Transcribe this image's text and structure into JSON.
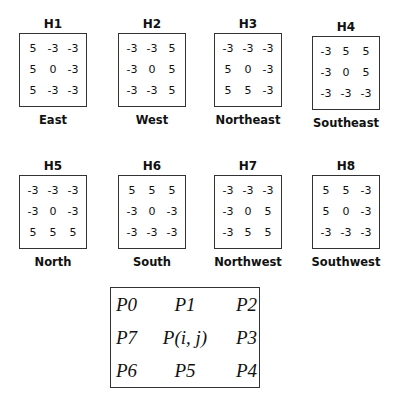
{
  "kernels": [
    {
      "id": "H1",
      "direction": "East",
      "matrix": [
        [
          "5",
          "-3",
          "-3"
        ],
        [
          "5",
          "0",
          "-3"
        ],
        [
          "5",
          "-3",
          "-3"
        ]
      ]
    },
    {
      "id": "H2",
      "direction": "West",
      "matrix": [
        [
          "-3",
          "-3",
          "5"
        ],
        [
          "-3",
          "0",
          "5"
        ],
        [
          "-3",
          "-3",
          "5"
        ]
      ]
    },
    {
      "id": "H3",
      "direction": "Northeast",
      "matrix": [
        [
          "-3",
          "-3",
          "-3"
        ],
        [
          "5",
          "0",
          "-3"
        ],
        [
          "5",
          "5",
          "-3"
        ]
      ]
    },
    {
      "id": "H4",
      "direction": "Southeast",
      "matrix": [
        [
          "-3",
          "5",
          "5"
        ],
        [
          "-3",
          "0",
          "5"
        ],
        [
          "-3",
          "-3",
          "-3"
        ]
      ]
    },
    {
      "id": "H5",
      "direction": "North",
      "matrix": [
        [
          "-3",
          "-3",
          "-3"
        ],
        [
          "-3",
          "0",
          "-3"
        ],
        [
          "5",
          "5",
          "5"
        ]
      ]
    },
    {
      "id": "H6",
      "direction": "South",
      "matrix": [
        [
          "5",
          "5",
          "5"
        ],
        [
          "-3",
          "0",
          "-3"
        ],
        [
          "-3",
          "-3",
          "-3"
        ]
      ]
    },
    {
      "id": "H7",
      "direction": "Northwest",
      "matrix": [
        [
          "-3",
          "-3",
          "-3"
        ],
        [
          "-3",
          "0",
          "5"
        ],
        [
          "-3",
          "5",
          "5"
        ]
      ]
    },
    {
      "id": "H8",
      "direction": "Southwest",
      "matrix": [
        [
          "5",
          "5",
          "-3"
        ],
        [
          "5",
          "0",
          "-3"
        ],
        [
          "-3",
          "-3",
          "-3"
        ]
      ]
    }
  ],
  "neighborhood": [
    [
      "P0",
      "P1",
      "P2"
    ],
    [
      "P7",
      "P(i, j)",
      "P3"
    ],
    [
      "P6",
      "P5",
      "P4"
    ]
  ]
}
